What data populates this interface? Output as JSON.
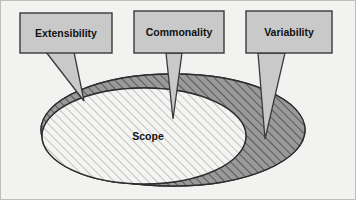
{
  "figure": {
    "name": "scope-diagram",
    "background_color": "#f2f2f0",
    "frame_border_color": "#b8b8b4",
    "caption": ""
  },
  "callouts": [
    {
      "id": "extensibility",
      "label": "Extensibility",
      "fill": "#c9c9c9",
      "stroke": "#3a3a3a",
      "box": {
        "x": 20,
        "y": 13,
        "w": 92,
        "h": 40
      },
      "tail_tip": {
        "x": 84,
        "y": 101
      }
    },
    {
      "id": "commonality",
      "label": "Commonality",
      "fill": "#c9c9c9",
      "stroke": "#3a3a3a",
      "box": {
        "x": 134,
        "y": 11,
        "w": 90,
        "h": 42
      },
      "tail_tip": {
        "x": 173,
        "y": 119
      }
    },
    {
      "id": "variability",
      "label": "Variability",
      "fill": "#c9c9c9",
      "stroke": "#3a3a3a",
      "box": {
        "x": 246,
        "y": 11,
        "w": 86,
        "h": 42
      },
      "tail_tip": {
        "x": 265,
        "y": 139
      }
    }
  ],
  "ellipses": {
    "back": {
      "id": "variability-region",
      "label": "",
      "cx": 173,
      "cy": 130,
      "rx": 132,
      "ry": 56,
      "fill": "#9a9a9a",
      "stroke": "#2e2e2e",
      "hatched": true
    },
    "front": {
      "id": "commonality-region",
      "label": "Scope",
      "cx": 144,
      "cy": 136,
      "rx": 102,
      "ry": 48,
      "fill": "#f0f0ee",
      "stroke": "#2e2e2e",
      "hatched": true
    }
  },
  "scope": {
    "label": "Scope",
    "x": 148,
    "y": 137
  },
  "colors": {
    "callout_fill": "#c9c9c9",
    "callout_stroke": "#3a3a3a",
    "ellipse_back_fill": "#9a9a9a",
    "ellipse_front_fill": "#f0f0ee",
    "ellipse_stroke": "#2e2e2e",
    "hatch_dark": "#5a5a5a",
    "hatch_light": "#c2c2c2",
    "text": "#111111",
    "panel_bg": "#f2f2f0"
  }
}
